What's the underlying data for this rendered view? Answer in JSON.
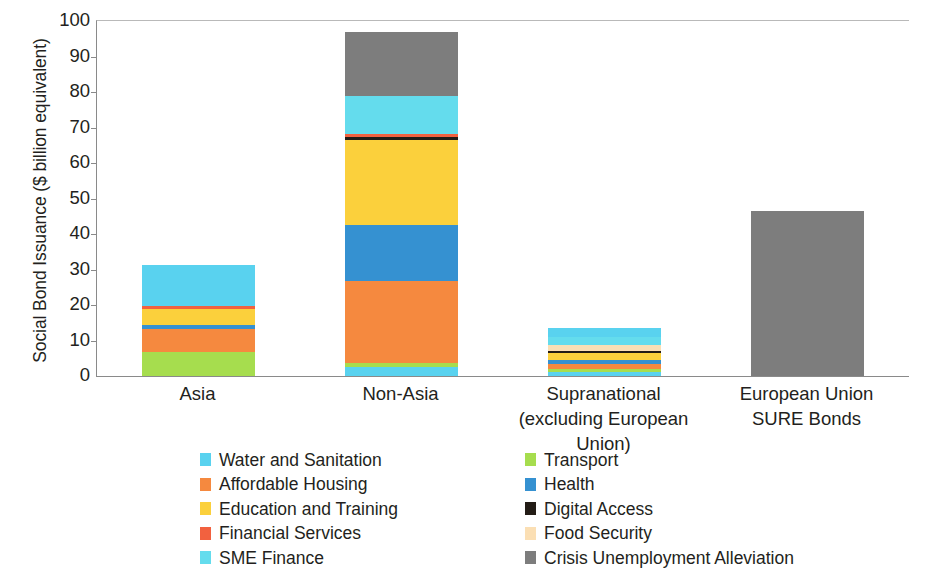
{
  "chart_data": {
    "type": "bar",
    "stacked": true,
    "title": "",
    "xlabel": "",
    "ylabel": "Social Bond Issuance ($ billion equivalent)",
    "ylim": [
      0,
      100
    ],
    "yticks": [
      0,
      10,
      20,
      30,
      40,
      50,
      60,
      70,
      80,
      90,
      100
    ],
    "grid": false,
    "legend_position": "bottom",
    "categories": [
      {
        "id": "asia",
        "line1": "Asia",
        "line2": ""
      },
      {
        "id": "non-asia",
        "line1": "Non-Asia",
        "line2": ""
      },
      {
        "id": "supranational",
        "line1": "Supranational",
        "line2": "(excluding European Union)"
      },
      {
        "id": "eu-sure",
        "line1": "European Union",
        "line2": "SURE Bonds"
      }
    ],
    "series": [
      {
        "name": "Water and Sanitation",
        "color": "#59d2ef",
        "values": [
          12.0,
          2.6,
          3.4,
          0.0
        ]
      },
      {
        "name": "Affordable Housing",
        "color": "#f5893f",
        "values": [
          7.4,
          22.9,
          1.4,
          0.0
        ]
      },
      {
        "name": "Education and Training",
        "color": "#fbd03c",
        "values": [
          4.5,
          23.8,
          2.0,
          0.0
        ]
      },
      {
        "name": "Financial Services",
        "color": "#f2613f",
        "values": [
          0.6,
          0.8,
          0.0,
          0.0
        ]
      },
      {
        "name": "SME Finance",
        "color": "#64dced",
        "values": [
          0.0,
          10.5,
          2.3,
          0.0
        ]
      },
      {
        "name": "Transport",
        "color": "#a6dd4e",
        "values": [
          6.8,
          1.2,
          0.8,
          0.0
        ]
      },
      {
        "name": "Health",
        "color": "#3591d1",
        "values": [
          1.3,
          15.9,
          1.1,
          0.0
        ]
      },
      {
        "name": "Digital Access",
        "color": "#231c16",
        "values": [
          0.0,
          1.0,
          0.6,
          0.0
        ]
      },
      {
        "name": "Food Security",
        "color": "#fbdfb4",
        "values": [
          0.0,
          0.0,
          1.6,
          0.0
        ]
      },
      {
        "name": "Crisis Unemployment Alleviation",
        "color": "#7d7d7d",
        "values": [
          0.0,
          18.2,
          0.0,
          46.5
        ]
      }
    ],
    "totals": [
      31.3,
      97.0,
      13.5,
      46.5
    ],
    "stack_order": [
      {
        "category": "asia",
        "segments": [
          {
            "series": "Transport",
            "value": 6.8
          },
          {
            "series": "Affordable Housing",
            "value": 6.4
          },
          {
            "series": "Health",
            "value": 1.3
          },
          {
            "series": "Education and Training",
            "value": 4.5
          },
          {
            "series": "Financial Services",
            "value": 0.6
          },
          {
            "series": "Water and Sanitation",
            "value": 11.7
          }
        ]
      },
      {
        "category": "non-asia",
        "segments": [
          {
            "series": "Water and Sanitation",
            "value": 2.6
          },
          {
            "series": "Transport",
            "value": 1.2
          },
          {
            "series": "Affordable Housing",
            "value": 22.9
          },
          {
            "series": "Health",
            "value": 15.9
          },
          {
            "series": "Education and Training",
            "value": 23.8
          },
          {
            "series": "Digital Access",
            "value": 1.0
          },
          {
            "series": "Financial Services",
            "value": 0.8
          },
          {
            "series": "SME Finance",
            "value": 10.6
          },
          {
            "series": "Crisis Unemployment Alleviation",
            "value": 18.2
          }
        ]
      },
      {
        "category": "supranational",
        "segments": [
          {
            "series": "Water and Sanitation",
            "value": 1.2
          },
          {
            "series": "Transport",
            "value": 0.8
          },
          {
            "series": "Affordable Housing",
            "value": 1.4
          },
          {
            "series": "Health",
            "value": 1.1
          },
          {
            "series": "Education and Training",
            "value": 2.0
          },
          {
            "series": "Digital Access",
            "value": 0.6
          },
          {
            "series": "Food Security",
            "value": 1.6
          },
          {
            "series": "SME Finance",
            "value": 2.3
          },
          {
            "series": "Water and Sanitation (top)",
            "value": 2.5
          }
        ]
      },
      {
        "category": "eu-sure",
        "segments": [
          {
            "series": "Crisis Unemployment Alleviation",
            "value": 46.5
          }
        ]
      }
    ]
  },
  "axis": {
    "y_title": "Social Bond Issuance ($ billion equivalent)",
    "tick_labels": [
      "100",
      "90",
      "80",
      "70",
      "60",
      "50",
      "40",
      "30",
      "20",
      "10",
      "0"
    ]
  },
  "legend": {
    "left": [
      {
        "label": "Water and Sanitation",
        "color": "#59d2ef"
      },
      {
        "label": "Affordable Housing",
        "color": "#f5893f"
      },
      {
        "label": "Education and Training",
        "color": "#fbd03c"
      },
      {
        "label": "Financial Services",
        "color": "#f2613f"
      },
      {
        "label": "SME Finance",
        "color": "#64dced"
      }
    ],
    "right": [
      {
        "label": "Transport",
        "color": "#a6dd4e"
      },
      {
        "label": "Health",
        "color": "#3591d1"
      },
      {
        "label": "Digital Access",
        "color": "#231c16"
      },
      {
        "label": "Food Security",
        "color": "#fbdfb4"
      },
      {
        "label": "Crisis Unemployment Alleviation",
        "color": "#7d7d7d"
      }
    ]
  }
}
